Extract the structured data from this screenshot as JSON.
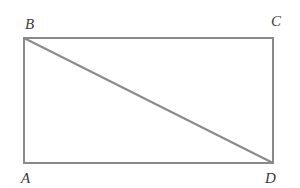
{
  "diagram": {
    "type": "rectangle-with-diagonal",
    "stroke_color": "#8a8a8a",
    "vertices": {
      "A": {
        "label": "A",
        "x": 24,
        "y": 163
      },
      "B": {
        "label": "B",
        "x": 24,
        "y": 38
      },
      "C": {
        "label": "C",
        "x": 273,
        "y": 38
      },
      "D": {
        "label": "D",
        "x": 273,
        "y": 163
      }
    },
    "diagonal": "BD"
  }
}
